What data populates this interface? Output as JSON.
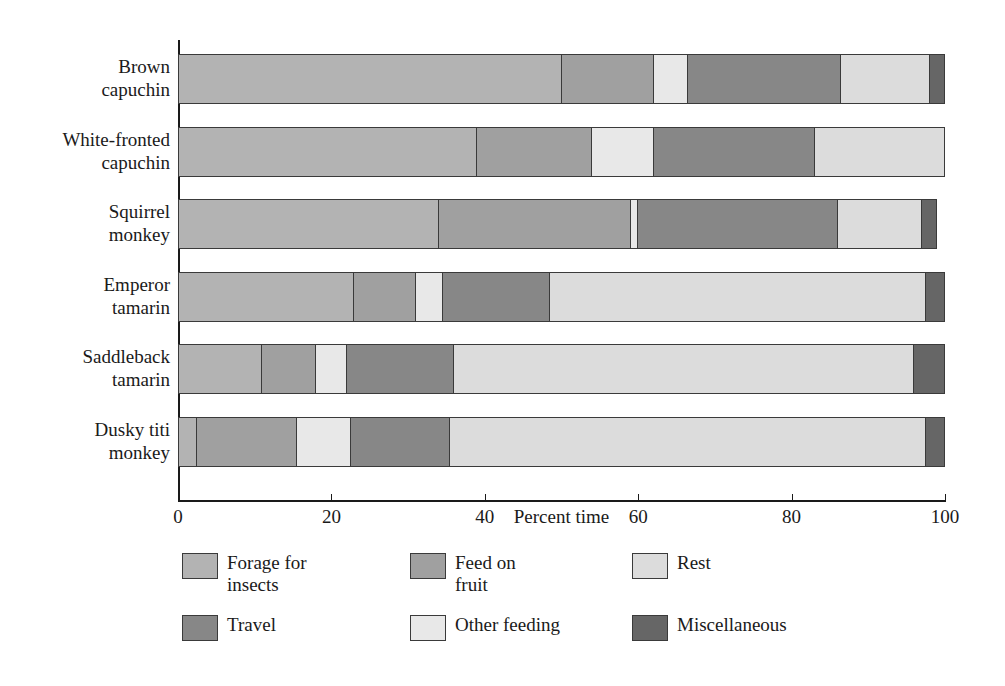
{
  "chart_data": {
    "type": "bar",
    "orientation": "horizontal",
    "stacked": true,
    "normalized_to_percent": true,
    "title": "",
    "xlabel": "Percent time",
    "ylabel": "",
    "xlim": [
      0,
      100
    ],
    "xticks": [
      0,
      20,
      40,
      60,
      80,
      100
    ],
    "xtick_labels": [
      "0",
      "20",
      "40",
      "60",
      "80",
      "100"
    ],
    "grid": false,
    "legend_position": "below-plot",
    "categories": [
      "Brown\ncapuchin",
      "White-fronted\ncapuchin",
      "Squirrel\nmonkey",
      "Emperor\ntamarin",
      "Saddleback\ntamarin",
      "Dusky titi\nmonkey"
    ],
    "series": [
      {
        "name": "Forage for insects",
        "color": "#b3b3b3",
        "values": [
          50,
          39,
          34,
          23,
          11,
          2.5
        ]
      },
      {
        "name": "Feed on fruit",
        "color": "#a0a0a0",
        "values": [
          12,
          15,
          25,
          8,
          7,
          13
        ]
      },
      {
        "name": "Other feeding",
        "color": "#e8e8e8",
        "values": [
          4.5,
          8,
          1,
          3.5,
          4,
          7
        ]
      },
      {
        "name": "Travel",
        "color": "#878787",
        "values": [
          20,
          21,
          26,
          14,
          14,
          13
        ]
      },
      {
        "name": "Rest",
        "color": "#dcdcdc",
        "values": [
          11.5,
          17,
          11,
          49,
          60,
          62
        ]
      },
      {
        "name": "Miscellaneous",
        "color": "#666666",
        "values": [
          2,
          0,
          2,
          2.5,
          4,
          2.5
        ]
      }
    ],
    "legend_entries": [
      {
        "label": "Forage for\ninsects",
        "color": "#b3b3b3"
      },
      {
        "label": "Feed on\nfruit",
        "color": "#a0a0a0"
      },
      {
        "label": "Rest",
        "color": "#dcdcdc"
      },
      {
        "label": "Travel",
        "color": "#878787"
      },
      {
        "label": "Other feeding",
        "color": "#e8e8e8"
      },
      {
        "label": "Miscellaneous",
        "color": "#666666"
      }
    ],
    "segment_order": [
      "Forage for insects",
      "Feed on fruit",
      "Other feeding",
      "Travel",
      "Rest",
      "Miscellaneous"
    ],
    "bars": [
      {
        "category": "Brown\ncapuchin",
        "segments": [
          {
            "name": "Forage for insects",
            "value": 50,
            "color": "#b3b3b3"
          },
          {
            "name": "Feed on fruit",
            "value": 12,
            "color": "#a0a0a0"
          },
          {
            "name": "Other feeding",
            "value": 4.5,
            "color": "#e8e8e8"
          },
          {
            "name": "Travel",
            "value": 20,
            "color": "#878787"
          },
          {
            "name": "Rest",
            "value": 11.5,
            "color": "#dcdcdc"
          },
          {
            "name": "Miscellaneous",
            "value": 2,
            "color": "#666666"
          }
        ]
      },
      {
        "category": "White-fronted\ncapuchin",
        "segments": [
          {
            "name": "Forage for insects",
            "value": 39,
            "color": "#b3b3b3"
          },
          {
            "name": "Feed on fruit",
            "value": 15,
            "color": "#a0a0a0"
          },
          {
            "name": "Other feeding",
            "value": 8,
            "color": "#e8e8e8"
          },
          {
            "name": "Travel",
            "value": 21,
            "color": "#878787"
          },
          {
            "name": "Rest",
            "value": 17,
            "color": "#dcdcdc"
          }
        ]
      },
      {
        "category": "Squirrel\nmonkey",
        "segments": [
          {
            "name": "Forage for insects",
            "value": 34,
            "color": "#b3b3b3"
          },
          {
            "name": "Feed on fruit",
            "value": 25,
            "color": "#a0a0a0"
          },
          {
            "name": "Other feeding",
            "value": 1,
            "color": "#e8e8e8"
          },
          {
            "name": "Travel",
            "value": 26,
            "color": "#878787"
          },
          {
            "name": "Rest",
            "value": 11,
            "color": "#dcdcdc"
          },
          {
            "name": "Miscellaneous",
            "value": 2,
            "color": "#666666"
          }
        ]
      },
      {
        "category": "Emperor\ntamarin",
        "segments": [
          {
            "name": "Forage for insects",
            "value": 23,
            "color": "#b3b3b3"
          },
          {
            "name": "Feed on fruit",
            "value": 8,
            "color": "#a0a0a0"
          },
          {
            "name": "Other feeding",
            "value": 3.5,
            "color": "#e8e8e8"
          },
          {
            "name": "Travel",
            "value": 14,
            "color": "#878787"
          },
          {
            "name": "Rest",
            "value": 49,
            "color": "#dcdcdc"
          },
          {
            "name": "Miscellaneous",
            "value": 2.5,
            "color": "#666666"
          }
        ]
      },
      {
        "category": "Saddleback\ntamarin",
        "segments": [
          {
            "name": "Forage for insects",
            "value": 11,
            "color": "#b3b3b3"
          },
          {
            "name": "Feed on fruit",
            "value": 7,
            "color": "#a0a0a0"
          },
          {
            "name": "Other feeding",
            "value": 4,
            "color": "#e8e8e8"
          },
          {
            "name": "Travel",
            "value": 14,
            "color": "#878787"
          },
          {
            "name": "Rest",
            "value": 60,
            "color": "#dcdcdc"
          },
          {
            "name": "Miscellaneous",
            "value": 4,
            "color": "#666666"
          }
        ]
      },
      {
        "category": "Dusky titi\nmonkey",
        "segments": [
          {
            "name": "Forage for insects",
            "value": 2.5,
            "color": "#b3b3b3"
          },
          {
            "name": "Feed on fruit",
            "value": 13,
            "color": "#a0a0a0"
          },
          {
            "name": "Other feeding",
            "value": 7,
            "color": "#e8e8e8"
          },
          {
            "name": "Travel",
            "value": 13,
            "color": "#878787"
          },
          {
            "name": "Rest",
            "value": 62,
            "color": "#dcdcdc"
          },
          {
            "name": "Miscellaneous",
            "value": 2.5,
            "color": "#666666"
          }
        ]
      }
    ]
  }
}
